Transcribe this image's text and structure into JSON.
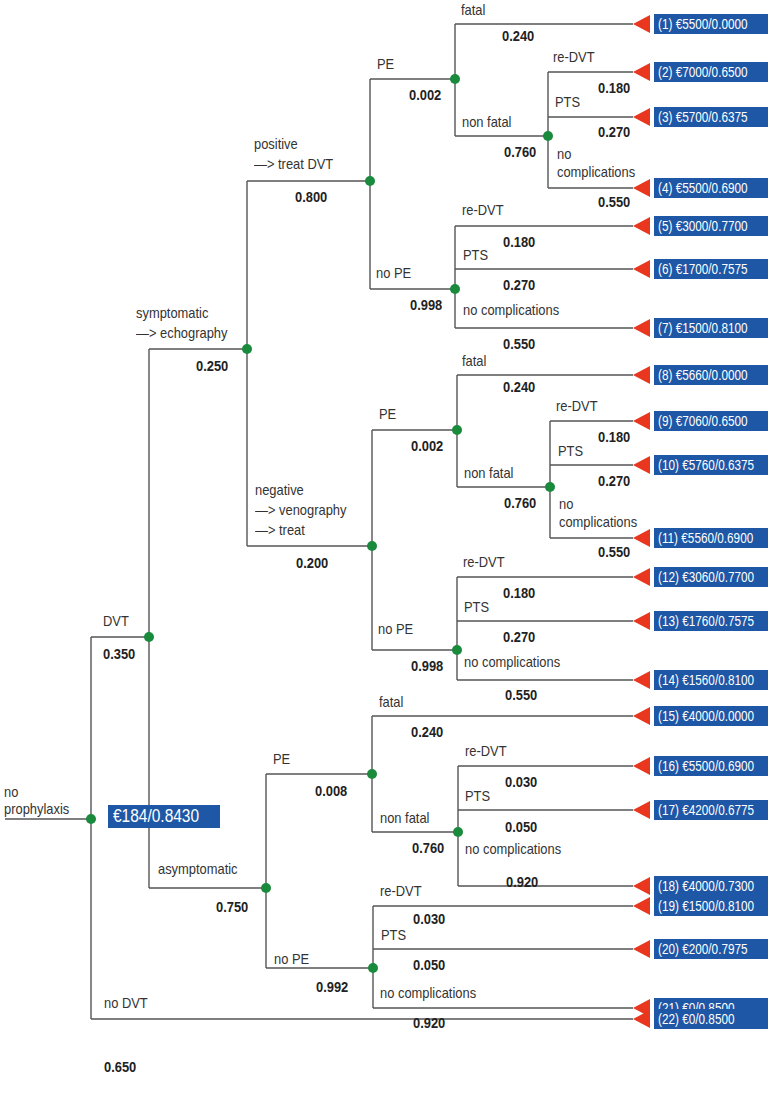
{
  "colors": {
    "line": "#555555",
    "chance_node": "#1a8a3c",
    "terminal": "#e8371e",
    "box": "#1e57a5",
    "box_text": "#ffffff"
  },
  "root": {
    "label_line1": "no",
    "label_line2": "prophylaxis",
    "expected_value": "€184/0.8430"
  },
  "branches": {
    "dvt": {
      "label": "DVT",
      "prob": "0.350"
    },
    "no_dvt": {
      "label": "no DVT",
      "prob": "0.650"
    },
    "symptomatic": {
      "label_line1": "symptomatic",
      "label_line2": "—> echography",
      "prob": "0.250"
    },
    "asymptomatic": {
      "label": "asymptomatic",
      "prob": "0.750"
    },
    "positive": {
      "label_line1": "positive",
      "label_line2": "—> treat DVT",
      "prob": "0.800"
    },
    "negative": {
      "label_line1": "negative",
      "label_line2": "—> venography",
      "label_line3": "—> treat",
      "prob": "0.200"
    },
    "pos_pe": {
      "label": "PE",
      "prob": "0.002"
    },
    "pos_no_pe": {
      "label": "no PE",
      "prob": "0.998"
    },
    "pos_pe_fatal": {
      "label": "fatal",
      "prob": "0.240"
    },
    "pos_pe_nonfatal": {
      "label": "non fatal",
      "prob": "0.760"
    },
    "pos_pe_nf_redvt": {
      "label": "re-DVT",
      "prob": "0.180"
    },
    "pos_pe_nf_pts": {
      "label": "PTS",
      "prob": "0.270"
    },
    "pos_pe_nf_nocomp": {
      "label_line1": "no",
      "label_line2": "complications",
      "prob": "0.550"
    },
    "pos_nope_redvt": {
      "label": "re-DVT",
      "prob": "0.180"
    },
    "pos_nope_pts": {
      "label": "PTS",
      "prob": "0.270"
    },
    "pos_nope_nocomp": {
      "label": "no complications",
      "prob": "0.550"
    },
    "neg_pe": {
      "label": "PE",
      "prob": "0.002"
    },
    "neg_no_pe": {
      "label": "no PE",
      "prob": "0.998"
    },
    "neg_pe_fatal": {
      "label": "fatal",
      "prob": "0.240"
    },
    "neg_pe_nonfatal": {
      "label": "non fatal",
      "prob": "0.760"
    },
    "neg_pe_nf_redvt": {
      "label": "re-DVT",
      "prob": "0.180"
    },
    "neg_pe_nf_pts": {
      "label": "PTS",
      "prob": "0.270"
    },
    "neg_pe_nf_nocomp": {
      "label_line1": "no",
      "label_line2": "complications",
      "prob": "0.550"
    },
    "neg_nope_redvt": {
      "label": "re-DVT",
      "prob": "0.180"
    },
    "neg_nope_pts": {
      "label": "PTS",
      "prob": "0.270"
    },
    "neg_nope_nocomp": {
      "label": "no complications",
      "prob": "0.550"
    },
    "asy_pe": {
      "label": "PE",
      "prob": "0.008"
    },
    "asy_no_pe": {
      "label": "no PE",
      "prob": "0.992"
    },
    "asy_pe_fatal": {
      "label": "fatal",
      "prob": "0.240"
    },
    "asy_pe_nonfatal": {
      "label": "non fatal",
      "prob": "0.760"
    },
    "asy_pe_nf_redvt": {
      "label": "re-DVT",
      "prob": "0.030"
    },
    "asy_pe_nf_pts": {
      "label": "PTS",
      "prob": "0.050"
    },
    "asy_pe_nf_nocomp": {
      "label": "no complications",
      "prob": "0.920"
    },
    "asy_nope_redvt": {
      "label": "re-DVT",
      "prob": "0.030"
    },
    "asy_nope_pts": {
      "label": "PTS",
      "prob": "0.050"
    },
    "asy_nope_nocomp": {
      "label": "no complications",
      "prob": "0.920"
    }
  },
  "outcomes": [
    "(1) €5500/0.0000",
    "(2) €7000/0.6500",
    "(3) €5700/0.6375",
    "(4) €5500/0.6900",
    "(5) €3000/0.7700",
    "(6) €1700/0.7575",
    "(7) €1500/0.8100",
    "(8) €5660/0.0000",
    "(9) €7060/0.6500",
    "(10) €5760/0.6375",
    "(11) €5560/0.6900",
    "(12) €3060/0.7700",
    "(13) €1760/0.7575",
    "(14) €1560/0.8100",
    "(15) €4000/0.0000",
    "(16) €5500/0.6900",
    "(17) €4200/0.6775",
    "(18) €4000/0.7300",
    "(19) €1500/0.8100",
    "(20) €200/0.7975",
    "(21) €0/0.8500",
    "(22) €0/0.8500"
  ]
}
